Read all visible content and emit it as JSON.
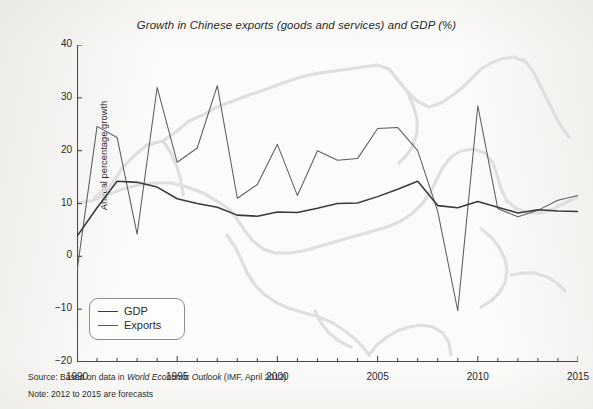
{
  "figure": {
    "title": "Growth in Chinese exports (goods and services) and GDP (%)",
    "source_prefix": "Source: Based on data in ",
    "source_italic": "World Economic Outlook",
    "source_suffix": " (IMF, April 2012)",
    "note": "Note: 2012 to 2015 are forecasts"
  },
  "legend": {
    "gdp_label": "GDP",
    "exports_label": "Exports"
  },
  "colors": {
    "gdp_line": "#3a3a3a",
    "exports_line": "#5d5d5d",
    "axis": "#4a4a4a",
    "watermark": "#dcdcdc",
    "background": "#fbfbfa"
  },
  "chart_data": {
    "type": "line",
    "title": "Growth in Chinese exports (goods and services) and GDP (%)",
    "xlabel": "",
    "ylabel": "Annual percentage growth",
    "xlim": [
      1990,
      2015
    ],
    "ylim": [
      -20,
      40
    ],
    "ytick_labels": [
      "40",
      "30",
      "20",
      "10",
      "0",
      "-10",
      "-20"
    ],
    "ytick_values": [
      40,
      30,
      20,
      10,
      0,
      -10,
      -20
    ],
    "xtick_labels": [
      "1990",
      "1995",
      "2000",
      "2005",
      "2010",
      "2015"
    ],
    "xtick_values": [
      1990,
      1995,
      2000,
      2005,
      2010,
      2015
    ],
    "minor_xticks_every": 1,
    "grid": false,
    "legend_position": "lower left",
    "x": [
      1990,
      1991,
      1992,
      1993,
      1994,
      1995,
      1996,
      1997,
      1998,
      1999,
      2000,
      2001,
      2002,
      2003,
      2004,
      2005,
      2006,
      2007,
      2008,
      2009,
      2010,
      2011,
      2012,
      2013,
      2014,
      2015
    ],
    "series": [
      {
        "name": "GDP",
        "values": [
          3.8,
          9.2,
          14.2,
          14.0,
          13.1,
          10.9,
          10.0,
          9.3,
          7.8,
          7.6,
          8.4,
          8.3,
          9.1,
          10.0,
          10.1,
          11.3,
          12.7,
          14.2,
          9.6,
          9.2,
          10.4,
          9.3,
          8.2,
          8.8,
          8.6,
          8.5
        ]
      },
      {
        "name": "Exports",
        "values": [
          -2.8,
          24.6,
          22.5,
          4.2,
          32.0,
          17.8,
          20.5,
          32.3,
          11.0,
          13.6,
          21.2,
          11.5,
          20.0,
          18.2,
          18.5,
          24.2,
          24.4,
          20.0,
          8.5,
          -10.3,
          28.5,
          9.0,
          7.5,
          8.7,
          10.6,
          11.5
        ]
      }
    ]
  },
  "watermark": {
    "name": "china-map-outline"
  }
}
